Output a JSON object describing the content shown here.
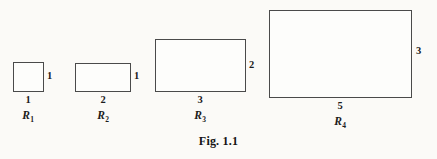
{
  "figure": {
    "caption": "Fig. 1.1",
    "caption_x_center": 220,
    "caption_y": 134,
    "background_color": "#fbfaf7",
    "stroke_color": "#4a4a4a",
    "text_color": "#1c1c1c"
  },
  "chart_data": {
    "type": "diagram",
    "title": "Fig. 1.1",
    "shape_kind": "rectangle",
    "categories": [
      "R_1",
      "R_2",
      "R_3",
      "R_4"
    ],
    "series": [
      {
        "name": "width",
        "values": [
          1,
          2,
          3,
          5
        ]
      },
      {
        "name": "height",
        "values": [
          1,
          1,
          2,
          3
        ]
      }
    ],
    "unit_pixels_per_unit": 28.6,
    "legend": "none",
    "grid": false
  },
  "rectangles": [
    {
      "id": "R_1",
      "name_text": "R",
      "name_subscript": "1",
      "width_label": "1",
      "height_label": "1",
      "geometry": {
        "x": 13,
        "y": 62,
        "w": 31,
        "h": 30
      },
      "width_label_pos": {
        "x": 28,
        "y": 95
      },
      "height_label_pos": {
        "x": 47,
        "y": 71
      },
      "name_pos": {
        "x": 28,
        "y": 110
      }
    },
    {
      "id": "R_2",
      "name_text": "R",
      "name_subscript": "2",
      "width_label": "2",
      "height_label": "1",
      "geometry": {
        "x": 75,
        "y": 63,
        "w": 56,
        "h": 29
      },
      "width_label_pos": {
        "x": 103,
        "y": 95
      },
      "height_label_pos": {
        "x": 134,
        "y": 71
      },
      "name_pos": {
        "x": 103,
        "y": 110
      }
    },
    {
      "id": "R_3",
      "name_text": "R",
      "name_subscript": "3",
      "width_label": "3",
      "height_label": "2",
      "geometry": {
        "x": 155,
        "y": 39,
        "w": 91,
        "h": 53
      },
      "width_label_pos": {
        "x": 200,
        "y": 95
      },
      "height_label_pos": {
        "x": 249,
        "y": 60
      },
      "name_pos": {
        "x": 200,
        "y": 110
      }
    },
    {
      "id": "R_4",
      "name_text": "R",
      "name_subscript": "4",
      "width_label": "5",
      "height_label": "3",
      "geometry": {
        "x": 269,
        "y": 10,
        "w": 143,
        "h": 88
      },
      "width_label_pos": {
        "x": 340,
        "y": 101
      },
      "height_label_pos": {
        "x": 416,
        "y": 46
      },
      "name_pos": {
        "x": 340,
        "y": 116
      }
    }
  ]
}
